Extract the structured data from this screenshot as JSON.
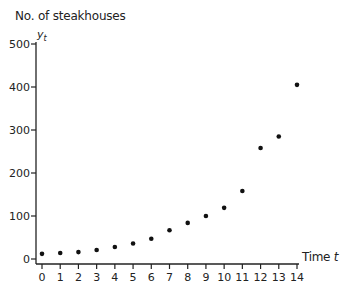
{
  "chart_data": {
    "type": "scatter",
    "title": "",
    "ylabel": "No. of steakhouses",
    "ylabel_variable": "y",
    "ylabel_subscript": "t",
    "xlabel": "Time",
    "xlabel_variable": "t",
    "x": [
      0,
      1,
      2,
      3,
      4,
      5,
      6,
      7,
      8,
      9,
      10,
      11,
      12,
      13,
      14
    ],
    "y": [
      12,
      14,
      16,
      21,
      28,
      36,
      47,
      67,
      84,
      100,
      119,
      158,
      258,
      285,
      405
    ],
    "xlim": [
      0,
      14
    ],
    "ylim": [
      0,
      500
    ],
    "xticks": [
      0,
      1,
      2,
      3,
      4,
      5,
      6,
      7,
      8,
      9,
      10,
      11,
      12,
      13,
      14
    ],
    "yticks": [
      0,
      100,
      200,
      300,
      400,
      500
    ],
    "grid": false,
    "legend": null,
    "marker_color": "#111111"
  }
}
